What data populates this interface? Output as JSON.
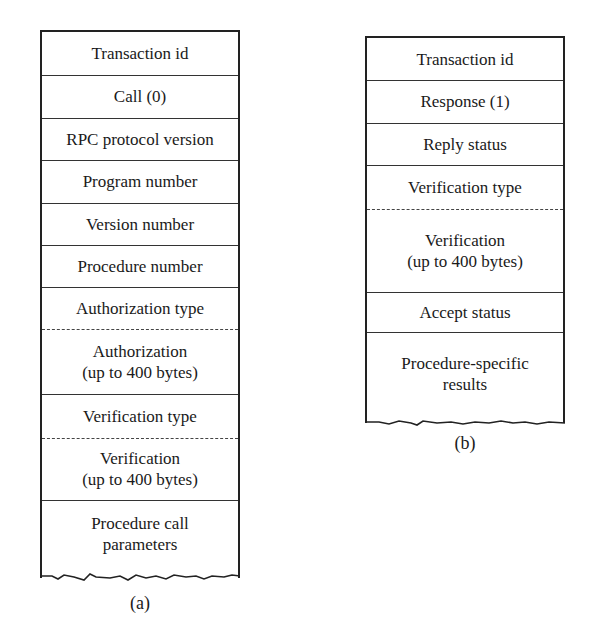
{
  "diagram_a": {
    "caption": "(a)",
    "fields": [
      {
        "label": "Transaction id"
      },
      {
        "label": "Call (0)"
      },
      {
        "label": "RPC protocol version"
      },
      {
        "label": "Program number"
      },
      {
        "label": "Version number"
      },
      {
        "label": "Procedure number"
      },
      {
        "label": "Authorization type"
      },
      {
        "label": "Authorization",
        "sub": "(up to 400 bytes)"
      },
      {
        "label": "Verification type"
      },
      {
        "label": "Verification",
        "sub": "(up to 400 bytes)"
      },
      {
        "label": "Procedure call",
        "sub": "parameters"
      }
    ]
  },
  "diagram_b": {
    "caption": "(b)",
    "fields": [
      {
        "label": "Transaction id"
      },
      {
        "label": "Response (1)"
      },
      {
        "label": "Reply status"
      },
      {
        "label": "Verification type"
      },
      {
        "label": "Verification",
        "sub": "(up to 400 bytes)"
      },
      {
        "label": "Accept status"
      },
      {
        "label": "Procedure-specific",
        "sub": "results"
      }
    ]
  }
}
